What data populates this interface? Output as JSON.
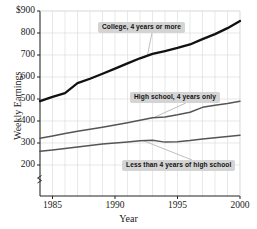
{
  "chart_data": {
    "type": "line",
    "title": "",
    "xlabel": "Year",
    "ylabel": "Weekly Earnings",
    "xlim": [
      1984,
      2000
    ],
    "ylim": [
      150,
      900
    ],
    "ytick_labels": [
      "$900",
      "800",
      "700",
      "600",
      "500",
      "400",
      "300",
      "200"
    ],
    "ytick_values": [
      900,
      800,
      700,
      600,
      500,
      400,
      300,
      200
    ],
    "xtick_labels": [
      "1985",
      "1990",
      "1995",
      "2000"
    ],
    "xtick_values": [
      1985,
      1990,
      1995,
      2000
    ],
    "axis_break": true,
    "grid": true,
    "grid_minor_x": "annual",
    "legend_position": "inline-callouts",
    "x": [
      1984,
      1985,
      1986,
      1987,
      1988,
      1989,
      1990,
      1991,
      1992,
      1993,
      1994,
      1995,
      1996,
      1997,
      1998,
      1999,
      2000
    ],
    "series": [
      {
        "name": "College, 4 years or more",
        "color": "#111111",
        "width": 2.3,
        "values": [
          490,
          510,
          527,
          572,
          592,
          615,
          638,
          662,
          685,
          705,
          718,
          732,
          748,
          772,
          795,
          822,
          855
        ]
      },
      {
        "name": "High school, 4 years only",
        "color": "#555555",
        "width": 1.5,
        "values": [
          322,
          332,
          343,
          353,
          363,
          372,
          382,
          392,
          403,
          415,
          418,
          428,
          440,
          462,
          472,
          480,
          490
        ]
      },
      {
        "name": "Less than 4 years of high school",
        "color": "#555555",
        "width": 1.5,
        "values": [
          262,
          268,
          275,
          282,
          289,
          295,
          300,
          305,
          310,
          313,
          304,
          306,
          311,
          318,
          324,
          330,
          335
        ]
      }
    ],
    "annotations": [
      {
        "label": "College, 4 years or more",
        "anchor_x": 1992.6,
        "anchor_y": 700
      },
      {
        "label": "High school, 4 years only",
        "anchor_x": 1993.2,
        "anchor_y": 418
      },
      {
        "label": "Less than 4 years of high school",
        "anchor_x": 1992.2,
        "anchor_y": 312
      }
    ]
  }
}
